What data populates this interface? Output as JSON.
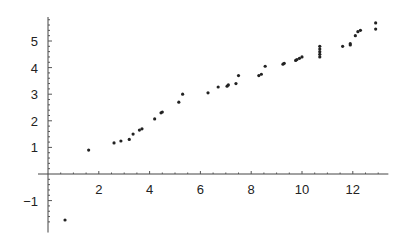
{
  "chart_data": {
    "type": "scatter",
    "title": "",
    "xlabel": "",
    "ylabel": "",
    "xlim": [
      0,
      13.4
    ],
    "ylim": [
      -1.9,
      5.8
    ],
    "grid": false,
    "legend": null,
    "x_ticks": [
      2,
      4,
      6,
      8,
      10,
      12
    ],
    "x_tick_labels": [
      "2",
      "4",
      "6",
      "8",
      "10",
      "12"
    ],
    "y_ticks": [
      -1,
      1,
      2,
      3,
      4,
      5
    ],
    "y_tick_labels": [
      "-1",
      "1",
      "2",
      "3",
      "4",
      "5"
    ],
    "series": [
      {
        "name": "data",
        "color": "#222222",
        "points": [
          [
            0.67,
            -1.73
          ],
          [
            1.6,
            0.9
          ],
          [
            2.6,
            1.17
          ],
          [
            2.87,
            1.24
          ],
          [
            3.2,
            1.3
          ],
          [
            3.35,
            1.5
          ],
          [
            3.6,
            1.65
          ],
          [
            3.7,
            1.7
          ],
          [
            4.2,
            2.07
          ],
          [
            4.45,
            2.3
          ],
          [
            4.5,
            2.33
          ],
          [
            5.15,
            2.7
          ],
          [
            5.3,
            3.0
          ],
          [
            6.3,
            3.05
          ],
          [
            6.7,
            3.27
          ],
          [
            7.05,
            3.3
          ],
          [
            7.1,
            3.35
          ],
          [
            7.4,
            3.4
          ],
          [
            7.5,
            3.7
          ],
          [
            8.3,
            3.7
          ],
          [
            8.4,
            3.75
          ],
          [
            8.55,
            4.05
          ],
          [
            9.25,
            4.13
          ],
          [
            9.3,
            4.16
          ],
          [
            9.75,
            4.27
          ],
          [
            9.8,
            4.3
          ],
          [
            9.9,
            4.35
          ],
          [
            10.0,
            4.4
          ],
          [
            10.7,
            4.4
          ],
          [
            10.7,
            4.5
          ],
          [
            10.7,
            4.6
          ],
          [
            10.7,
            4.7
          ],
          [
            10.7,
            4.8
          ],
          [
            11.6,
            4.8
          ],
          [
            11.9,
            4.85
          ],
          [
            11.9,
            4.9
          ],
          [
            12.1,
            5.2
          ],
          [
            12.2,
            5.35
          ],
          [
            12.3,
            5.4
          ],
          [
            12.9,
            5.45
          ],
          [
            12.9,
            5.68
          ]
        ]
      }
    ]
  }
}
